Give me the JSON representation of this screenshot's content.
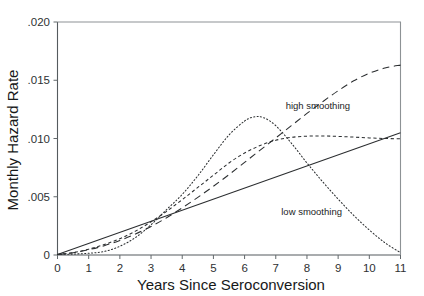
{
  "chart_data": {
    "type": "line",
    "title": "",
    "xlabel": "Years Since Seroconversion",
    "ylabel": "Monthly Hazard Rate",
    "xlim": [
      0,
      11
    ],
    "ylim": [
      0,
      0.02
    ],
    "grid": false,
    "legend_position": "inline-annotations",
    "x_ticks": [
      0,
      1,
      2,
      3,
      4,
      5,
      6,
      7,
      8,
      9,
      10,
      11
    ],
    "x_tick_labels": [
      "0",
      "1",
      "2",
      "3",
      "4",
      "5",
      "6",
      "7",
      "8",
      "9",
      "10",
      "11"
    ],
    "y_ticks": [
      0,
      0.005,
      0.01,
      0.015,
      0.02
    ],
    "y_tick_labels": [
      "0",
      ".005",
      ".010",
      ".015",
      ".020"
    ],
    "annotations": [
      {
        "text": "high smoothing",
        "x": 8.35,
        "y": 0.01255
      },
      {
        "text": "low smoothing",
        "x": 8.15,
        "y": 0.00345
      }
    ],
    "series": [
      {
        "name": "straight-line",
        "style": "solid",
        "x": [
          0,
          1,
          2,
          3,
          4,
          5,
          6,
          7,
          8,
          9,
          10,
          11
        ],
        "values": [
          5e-05,
          0.001,
          0.00195,
          0.0029,
          0.00385,
          0.0048,
          0.00575,
          0.0067,
          0.00765,
          0.0086,
          0.00955,
          0.0105
        ]
      },
      {
        "name": "high smoothing",
        "style": "long-dash",
        "x": [
          0,
          0.5,
          1,
          1.5,
          2,
          2.5,
          3,
          3.5,
          4,
          4.5,
          5,
          5.5,
          6,
          6.5,
          7,
          7.5,
          8,
          8.5,
          9,
          9.5,
          10,
          10.5,
          11
        ],
        "values": [
          5e-05,
          0.0002,
          0.00045,
          0.0008,
          0.00125,
          0.0018,
          0.00245,
          0.0032,
          0.00405,
          0.00495,
          0.0059,
          0.0069,
          0.00795,
          0.009,
          0.01005,
          0.0111,
          0.01215,
          0.01315,
          0.0141,
          0.01495,
          0.0156,
          0.01605,
          0.0163
        ]
      },
      {
        "name": "medium smoothing",
        "style": "short-dash",
        "x": [
          0,
          0.5,
          1,
          1.5,
          2,
          2.5,
          3,
          3.5,
          4,
          4.5,
          5,
          5.5,
          6,
          6.5,
          7,
          7.5,
          8,
          8.5,
          9,
          9.5,
          10,
          10.5,
          11
        ],
        "values": [
          5e-05,
          0.0002,
          0.0005,
          0.0009,
          0.0014,
          0.00205,
          0.00285,
          0.00375,
          0.00475,
          0.0058,
          0.00685,
          0.0079,
          0.00875,
          0.0094,
          0.00985,
          0.0101,
          0.0102,
          0.01022,
          0.01018,
          0.01012,
          0.01005,
          0.01,
          0.00998
        ]
      },
      {
        "name": "low smoothing",
        "style": "dotted",
        "x": [
          0,
          0.5,
          1,
          1.5,
          2,
          2.5,
          3,
          3.5,
          4,
          4.5,
          5,
          5.5,
          6,
          6.3,
          6.6,
          7,
          7.5,
          8,
          8.5,
          9,
          9.5,
          10,
          10.5,
          11
        ],
        "values": [
          5e-05,
          8e-05,
          0.00015,
          0.0003,
          0.00075,
          0.0015,
          0.0026,
          0.0039,
          0.0052,
          0.0068,
          0.0086,
          0.0103,
          0.0115,
          0.01185,
          0.0118,
          0.0111,
          0.0096,
          0.0079,
          0.0063,
          0.0048,
          0.0034,
          0.00215,
          0.00105,
          0.0002
        ]
      }
    ]
  }
}
